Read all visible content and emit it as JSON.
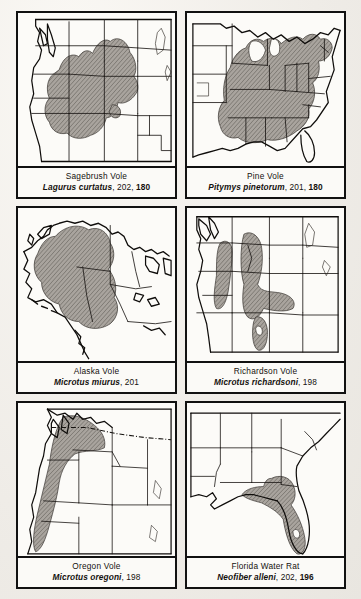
{
  "page": {
    "background_color": "#f2f0ec",
    "border_color": "#111111",
    "range_fill_color": "#9a958f",
    "panel_count": 6,
    "layout": "2 columns x 3 rows"
  },
  "panels": [
    {
      "id": "sagebrush-vole",
      "common_name": "Sagebrush Vole",
      "scientific_name": "Lagurus curtatus",
      "page_refs": [
        "202",
        "180"
      ],
      "bold_ref": "180",
      "map_region": "Western United States",
      "range_description": "Great Basin, Columbia Plateau, northern Rockies, eastern Montana and Wyoming"
    },
    {
      "id": "pine-vole",
      "common_name": "Pine Vole",
      "scientific_name": "Pitymys pinetorum",
      "page_refs": [
        "201",
        "180"
      ],
      "bold_ref": "180",
      "map_region": "Eastern United States",
      "range_description": "Eastern deciduous forest from New England and Great Lakes south to Gulf Coast and east Texas"
    },
    {
      "id": "alaska-vole",
      "common_name": "Alaska Vole",
      "scientific_name": "Microtus miurus",
      "page_refs": [
        "201"
      ],
      "bold_ref": "",
      "map_region": "Alaska and northwestern Canada",
      "range_description": "Interior and northern Alaska extending into Yukon"
    },
    {
      "id": "richardson-vole",
      "common_name": "Richardson Vole",
      "scientific_name": "Microtus richardsoni",
      "page_refs": [
        "198"
      ],
      "bold_ref": "",
      "map_region": "Northwestern United States",
      "range_description": "Cascade Range, northern Rockies, Wyoming and Utah mountains"
    },
    {
      "id": "oregon-vole",
      "common_name": "Oregon Vole",
      "scientific_name": "Microtus oregoni",
      "page_refs": [
        "198"
      ],
      "bold_ref": "",
      "map_region": "Pacific Northwest",
      "range_description": "Coastal Washington, Oregon and northern California west of the Cascades"
    },
    {
      "id": "florida-water-rat",
      "common_name": "Florida Water Rat",
      "scientific_name": "Neofiber alleni",
      "page_refs": [
        "202",
        "196"
      ],
      "bold_ref": "196",
      "map_region": "Southeastern United States",
      "range_description": "Peninsular Florida and southern Georgia"
    }
  ]
}
